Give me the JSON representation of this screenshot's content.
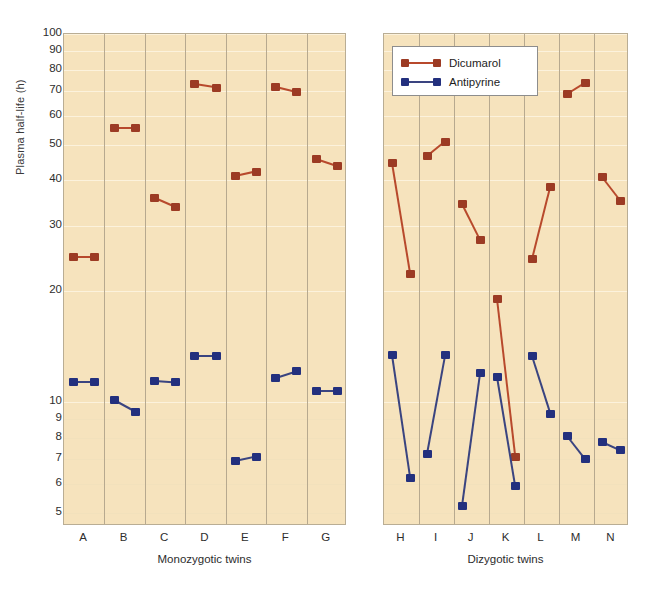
{
  "chart_data": {
    "type": "line",
    "title": "",
    "subtitle": "",
    "ylabel": "Plasma half-life (h)",
    "yscale": "log",
    "ylim": [
      4.6,
      100
    ],
    "yticks": [
      100,
      90,
      80,
      70,
      60,
      50,
      40,
      30,
      20,
      10,
      9,
      8,
      7,
      6,
      5
    ],
    "grid": true,
    "legend_position": "top-right-of-right-panel",
    "legend": [
      {
        "name": "Dicumarol",
        "color": "#a83f26"
      },
      {
        "name": "Antipyrine",
        "color": "#23307e"
      }
    ],
    "panels": [
      {
        "id": "panel-left",
        "xlabel": "Monozygotic twins",
        "categories": [
          "A",
          "B",
          "C",
          "D",
          "E",
          "F",
          "G"
        ],
        "series": [
          {
            "name": "Dicumarol",
            "color": "#a83f26",
            "pairs": [
              {
                "category": "A",
                "twin1": 24.8,
                "twin2": 24.8
              },
              {
                "category": "B",
                "twin1": 55.5,
                "twin2": 55.5
              },
              {
                "category": "C",
                "twin1": 35.8,
                "twin2": 33.8
              },
              {
                "category": "D",
                "twin1": 73.0,
                "twin2": 71.5
              },
              {
                "category": "E",
                "twin1": 41.0,
                "twin2": 42.2
              },
              {
                "category": "F",
                "twin1": 71.8,
                "twin2": 69.5
              },
              {
                "category": "G",
                "twin1": 45.8,
                "twin2": 43.8
              }
            ]
          },
          {
            "name": "Antipyrine",
            "color": "#23307e",
            "pairs": [
              {
                "category": "A",
                "twin1": 11.3,
                "twin2": 11.3
              },
              {
                "category": "B",
                "twin1": 10.1,
                "twin2": 9.4
              },
              {
                "category": "C",
                "twin1": 11.4,
                "twin2": 11.3
              },
              {
                "category": "D",
                "twin1": 13.3,
                "twin2": 13.3
              },
              {
                "category": "E",
                "twin1": 6.9,
                "twin2": 7.1
              },
              {
                "category": "F",
                "twin1": 11.6,
                "twin2": 12.1
              },
              {
                "category": "G",
                "twin1": 10.7,
                "twin2": 10.7
              }
            ]
          }
        ]
      },
      {
        "id": "panel-right",
        "xlabel": "Dizygotic twins",
        "categories": [
          "H",
          "I",
          "J",
          "K",
          "L",
          "M",
          "N"
        ],
        "series": [
          {
            "name": "Dicumarol",
            "color": "#a83f26",
            "pairs": [
              {
                "category": "H",
                "twin1": 44.5,
                "twin2": 22.2
              },
              {
                "category": "I",
                "twin1": 46.5,
                "twin2": 51.0
              },
              {
                "category": "J",
                "twin1": 34.5,
                "twin2": 27.5
              },
              {
                "category": "K",
                "twin1": 19.0,
                "twin2": 7.1
              },
              {
                "category": "L",
                "twin1": 24.5,
                "twin2": 38.5
              },
              {
                "category": "M",
                "twin1": 68.5,
                "twin2": 73.5
              },
              {
                "category": "N",
                "twin1": 40.8,
                "twin2": 35.2
              }
            ]
          },
          {
            "name": "Antipyrine",
            "color": "#23307e",
            "pairs": [
              {
                "category": "H",
                "twin1": 13.4,
                "twin2": 6.2
              },
              {
                "category": "I",
                "twin1": 7.2,
                "twin2": 13.4
              },
              {
                "category": "J",
                "twin1": 5.2,
                "twin2": 12.0
              },
              {
                "category": "K",
                "twin1": 11.7,
                "twin2": 5.9
              },
              {
                "category": "L",
                "twin1": 13.3,
                "twin2": 9.3
              },
              {
                "category": "M",
                "twin1": 8.1,
                "twin2": 7.0
              },
              {
                "category": "N",
                "twin1": 7.8,
                "twin2": 7.4
              }
            ]
          }
        ]
      }
    ]
  }
}
